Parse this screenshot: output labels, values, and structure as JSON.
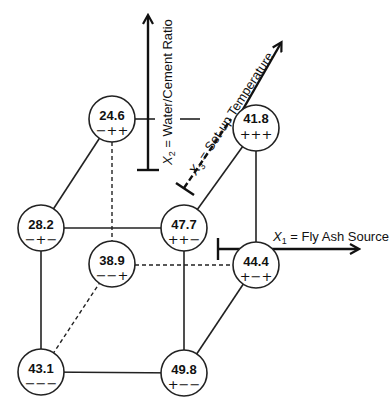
{
  "diagram": {
    "type": "2^3 factorial design cube",
    "axes": {
      "x1": {
        "symbol": "X",
        "subscript": "1",
        "label": " = Fly Ash Source"
      },
      "x2": {
        "symbol": "X",
        "subscript": "2",
        "label": " = Water/Cement Ratio"
      },
      "x3": {
        "symbol": "X",
        "subscript": "3",
        "label": " = Set-up Temperature"
      }
    },
    "nodes": [
      {
        "id": "n1",
        "value": "24.6",
        "signs": "−++"
      },
      {
        "id": "n2",
        "value": "41.8",
        "signs": "+++"
      },
      {
        "id": "n3",
        "value": "28.2",
        "signs": "−+−"
      },
      {
        "id": "n4",
        "value": "47.7",
        "signs": "++−"
      },
      {
        "id": "n5",
        "value": "38.9",
        "signs": "−−+"
      },
      {
        "id": "n6",
        "value": "44.4",
        "signs": "+−+"
      },
      {
        "id": "n7",
        "value": "43.1",
        "signs": "−−−"
      },
      {
        "id": "n8",
        "value": "49.8",
        "signs": "+−−"
      }
    ]
  }
}
